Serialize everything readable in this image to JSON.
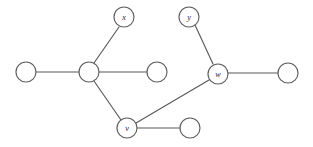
{
  "figure": {
    "width": 313,
    "height": 147,
    "background_color": "#ffffff",
    "edge_color": "#595959",
    "node_stroke_color": "#5e5e5e",
    "node_fill_color": "#ffffff",
    "label_color": "#262626",
    "node_radius": 10
  },
  "graph": {
    "type": "undirected-graph-diagram",
    "node_count": 9,
    "edge_count": 8,
    "nodes": [
      {
        "id": "n1",
        "label": "",
        "cx": 26,
        "cy": 72,
        "r": 10
      },
      {
        "id": "n2",
        "label": "",
        "cx": 89,
        "cy": 72,
        "r": 10
      },
      {
        "id": "n3",
        "label": "",
        "cx": 157,
        "cy": 72,
        "r": 10
      },
      {
        "id": "x",
        "label": "x",
        "cx": 124,
        "cy": 17,
        "r": 10
      },
      {
        "id": "y",
        "label": "y",
        "cx": 189,
        "cy": 17,
        "r": 10
      },
      {
        "id": "w",
        "label": "w",
        "cx": 218,
        "cy": 74,
        "r": 10
      },
      {
        "id": "n4",
        "label": "",
        "cx": 288,
        "cy": 73,
        "r": 10
      },
      {
        "id": "v",
        "label": "v",
        "cx": 127,
        "cy": 128,
        "r": 10
      },
      {
        "id": "n5",
        "label": "",
        "cx": 190,
        "cy": 128,
        "r": 10
      }
    ],
    "edges": [
      {
        "id": "e1",
        "source": "n1",
        "target": "n2",
        "x1": 36,
        "y1": 72,
        "x2": 79,
        "y2": 72
      },
      {
        "id": "e2",
        "source": "n2",
        "target": "n3",
        "x1": 99,
        "y1": 72,
        "x2": 147,
        "y2": 72
      },
      {
        "id": "e3",
        "source": "n2",
        "target": "x",
        "x1": 94,
        "y1": 63,
        "x2": 119,
        "y2": 27
      },
      {
        "id": "e4",
        "source": "n2",
        "target": "v",
        "x1": 94,
        "y1": 81,
        "x2": 121,
        "y2": 120
      },
      {
        "id": "e5",
        "source": "y",
        "target": "w",
        "x1": 195,
        "y1": 25,
        "x2": 213,
        "y2": 64
      },
      {
        "id": "e6",
        "source": "w",
        "target": "n4",
        "x1": 228,
        "y1": 73,
        "x2": 278,
        "y2": 73
      },
      {
        "id": "e7",
        "source": "w",
        "target": "v",
        "x1": 209,
        "y1": 80,
        "x2": 136,
        "y2": 123
      },
      {
        "id": "e8",
        "source": "v",
        "target": "n5",
        "x1": 137,
        "y1": 128,
        "x2": 180,
        "y2": 128
      }
    ]
  }
}
